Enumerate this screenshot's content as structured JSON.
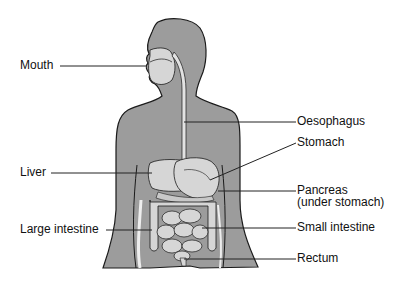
{
  "diagram": {
    "title": "",
    "colors": {
      "body": "#9c9c9c",
      "organ": "#d6d6d6",
      "outline": "#1a1a1a",
      "leader": "#222222"
    },
    "labels": [
      {
        "id": "mouth",
        "text": "Mouth",
        "side": "left"
      },
      {
        "id": "oesophagus",
        "text": "Oesophagus",
        "side": "right"
      },
      {
        "id": "stomach",
        "text": "Stomach",
        "side": "right"
      },
      {
        "id": "liver",
        "text": "Liver",
        "side": "left"
      },
      {
        "id": "pancreas",
        "text": "Pancreas",
        "side": "right"
      },
      {
        "id": "pancreas_note",
        "text": "(under stomach)",
        "side": "right"
      },
      {
        "id": "large_intestine",
        "text": "Large intestine",
        "side": "left"
      },
      {
        "id": "small_intestine",
        "text": "Small intestine",
        "side": "right"
      },
      {
        "id": "rectum",
        "text": "Rectum",
        "side": "right"
      }
    ]
  }
}
